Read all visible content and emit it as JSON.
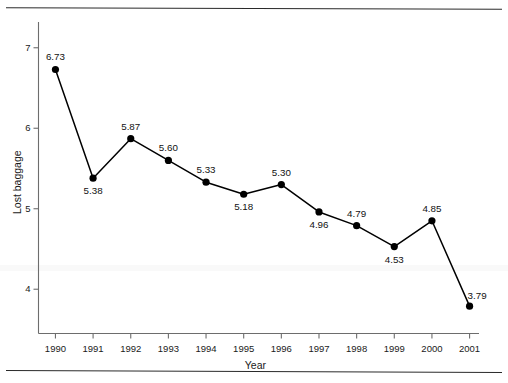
{
  "chart_data": {
    "type": "line",
    "title": "",
    "xlabel": "Year",
    "ylabel": "Lost baggage",
    "categories": [
      "1990",
      "1991",
      "1992",
      "1993",
      "1994",
      "1995",
      "1996",
      "1997",
      "1998",
      "1999",
      "2000",
      "2001"
    ],
    "x": [
      1990,
      1991,
      1992,
      1993,
      1994,
      1995,
      1996,
      1997,
      1998,
      1999,
      2000,
      2001
    ],
    "values": [
      6.73,
      5.38,
      5.87,
      5.6,
      5.33,
      5.18,
      5.3,
      4.96,
      4.79,
      4.53,
      4.85,
      3.79
    ],
    "point_labels": [
      "6.73",
      "5.38",
      "5.87",
      "5.60",
      "5.33",
      "5.18",
      "5.30",
      "4.96",
      "4.79",
      "4.53",
      "4.85",
      "3.79"
    ],
    "label_positions": [
      "above",
      "below",
      "above",
      "above",
      "above",
      "below",
      "above",
      "below",
      "above",
      "below",
      "above",
      "above-right"
    ],
    "ytick_labels": [
      "4",
      "5",
      "6",
      "7"
    ],
    "yticks": [
      4,
      5,
      6,
      7
    ],
    "ylim": [
      3.45,
      7.32
    ],
    "xlim": [
      1989.55,
      2001.25
    ],
    "grid": false,
    "legend": "none",
    "marker": "filled-circle",
    "line_color": "#000000",
    "marker_color": "#000000",
    "axis_color": "#6d6d6d"
  },
  "decor": {
    "top_rule": "horizontal-rule",
    "bottom_rule": "horizontal-rule"
  }
}
